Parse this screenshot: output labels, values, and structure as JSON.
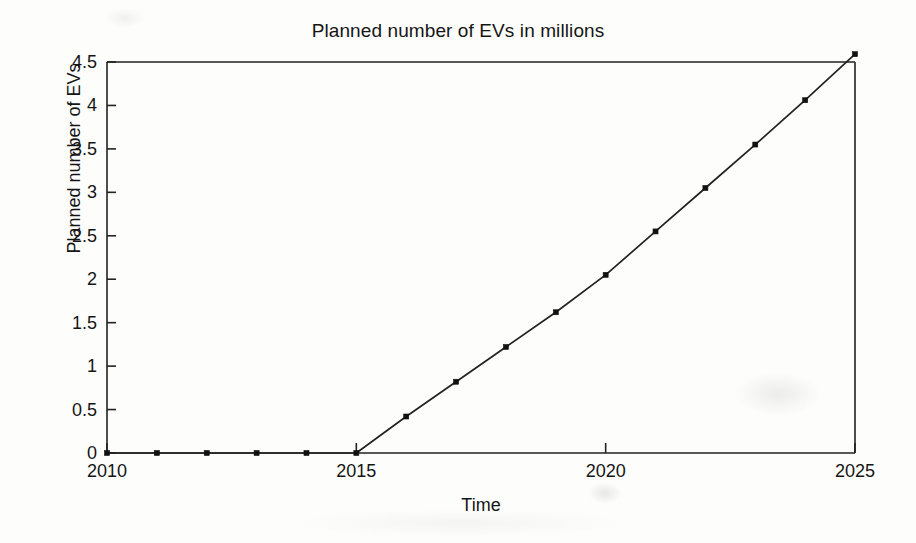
{
  "chart_data": {
    "type": "line",
    "title": "Planned number of EVs in millions",
    "xlabel": "Time",
    "ylabel": "Planned number of EVs",
    "xlim": [
      2010,
      2025
    ],
    "ylim": [
      0,
      4.5
    ],
    "grid": false,
    "legend": null,
    "marker": "square",
    "line_color": "#222222",
    "marker_color": "#111111",
    "background_color": "#fdfdfc",
    "x": [
      2010,
      2011,
      2012,
      2013,
      2014,
      2015,
      2016,
      2017,
      2018,
      2019,
      2020,
      2021,
      2022,
      2023,
      2024,
      2025
    ],
    "values": [
      0,
      0,
      0,
      0,
      0,
      0,
      0.42,
      0.82,
      1.22,
      1.62,
      2.05,
      2.55,
      3.05,
      3.55,
      4.06,
      4.59
    ],
    "xticks": [
      2010,
      2015,
      2020,
      2025
    ],
    "xtick_labels": [
      "2010",
      "2015",
      "2020",
      "2025"
    ],
    "yticks": [
      0,
      0.5,
      1,
      1.5,
      2,
      2.5,
      3,
      3.5,
      4,
      4.5
    ],
    "ytick_labels": [
      "0",
      "0.5",
      "1",
      "1.5",
      "2",
      "2.5",
      "3",
      "3.5",
      "4",
      "4.5"
    ]
  }
}
